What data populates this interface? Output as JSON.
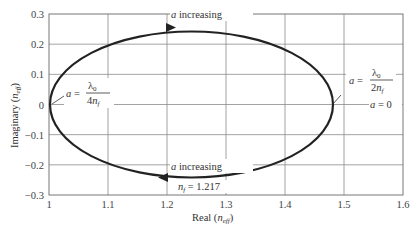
{
  "chart_data": {
    "type": "line",
    "title": "",
    "xlabel": "Real (n_eff)",
    "ylabel": "Imaginary (n_eff)",
    "xlim": [
      1.0,
      1.6
    ],
    "ylim": [
      -0.3,
      0.3
    ],
    "xticks": [
      "1",
      "1.1",
      "1.2",
      "1.3",
      "1.4",
      "1.5",
      "1.6"
    ],
    "yticks": [
      "0.3",
      "0.2",
      "0.1",
      "0",
      "−0.1",
      "−0.2",
      "−0.3"
    ],
    "grid": true,
    "legend": null,
    "series": [
      {
        "name": "n_eff locus (ellipse)",
        "shape": "closed ellipse",
        "center": [
          1.24,
          0.0
        ],
        "real_range": [
          1.0,
          1.48
        ],
        "imag_range": [
          -0.245,
          0.245
        ]
      }
    ],
    "annotations": [
      {
        "text": "a increasing",
        "x": 1.22,
        "y": 0.27,
        "arrow": "rightward along top"
      },
      {
        "text": "a increasing",
        "x": 1.22,
        "y": -0.19,
        "arrow": "leftward along bottom"
      },
      {
        "text": "a = λ0 / 4n_f",
        "x": 1.05,
        "y": 0.03,
        "points_to": [
          1.0,
          0.0
        ]
      },
      {
        "text": "a = λ0 / 2n_f",
        "x": 1.53,
        "y": 0.09
      },
      {
        "text": "a = 0",
        "x": 1.53,
        "y": 0.0,
        "points_to": [
          1.48,
          0.0
        ]
      },
      {
        "text": "n_f = 1.217",
        "x": 1.25,
        "y": -0.265
      }
    ]
  },
  "labels": {
    "xaxis": "Real",
    "xaxis_sub": "eff",
    "yaxis": "Imaginary",
    "yaxis_sub": "eff",
    "a_increasing_top": "a increasing",
    "a_increasing_bottom": "a increasing",
    "nf_value": "= 1.217",
    "a_zero": "a = 0"
  }
}
